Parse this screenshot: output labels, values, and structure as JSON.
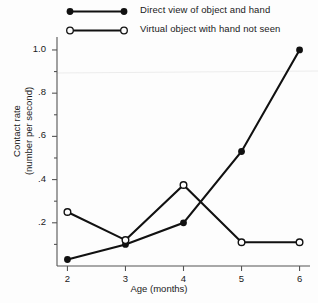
{
  "chart_data": {
    "type": "line",
    "title": "",
    "xlabel": "Age (months)",
    "ylabel_line1": "Contact rate",
    "ylabel_line2": "(number per second)",
    "x": [
      2,
      3,
      4,
      5,
      6
    ],
    "xlim": [
      1.82,
      6.18
    ],
    "ylim": [
      0,
      1.06
    ],
    "xticks": [
      "2",
      "3",
      "4",
      "5",
      "6"
    ],
    "yticks": [
      "1.0",
      ".8",
      ".6",
      ".4",
      ".2"
    ],
    "ytick_values": [
      1.0,
      0.8,
      0.6,
      0.4,
      0.2
    ],
    "yminor_values": [
      0.9,
      0.7,
      0.5,
      0.3,
      0.1
    ],
    "grid": false,
    "legend_position": "top",
    "series": [
      {
        "name": "Direct view of object and hand",
        "marker": "filled-circle",
        "values": [
          0.03,
          0.1,
          0.2,
          0.53,
          1.0
        ]
      },
      {
        "name": "Virtual object with hand not seen",
        "marker": "open-circle",
        "values": [
          0.25,
          0.12,
          0.375,
          0.11,
          0.11
        ]
      }
    ]
  },
  "legend": {
    "items": [
      {
        "label": "Direct view of object and hand",
        "marker": "filled-circle"
      },
      {
        "label": "Virtual object with hand not seen",
        "marker": "open-circle"
      }
    ]
  },
  "colors": {
    "line": "#111111",
    "text": "#1a1a1a",
    "axis": "#555555",
    "background": "#fdfdfd",
    "artifact_line": "#e8e8e8"
  }
}
